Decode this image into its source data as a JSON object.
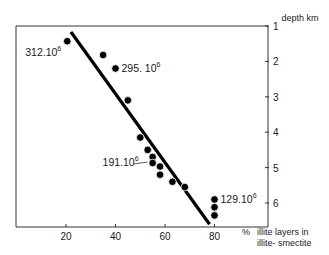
{
  "chart_data": {
    "type": "scatter",
    "title": "",
    "xlabel": "% illite layers in illite- smectite",
    "xlabel_lines": [
      "illite layers in",
      "illite- smectite"
    ],
    "xlabel_unit": "%",
    "ylabel": "depth  km",
    "xlim": [
      0,
      100
    ],
    "ylim": [
      1,
      6.7
    ],
    "y_inverted": true,
    "y_axis_side": "right",
    "x_ticks": [
      20,
      40,
      60,
      80
    ],
    "y_ticks": [
      1,
      2,
      3,
      4,
      5,
      6
    ],
    "grid": false,
    "series": [
      {
        "name": "samples",
        "points": [
          {
            "x": 20.5,
            "y": 1.43
          },
          {
            "x": 35,
            "y": 1.82
          },
          {
            "x": 40,
            "y": 2.2
          },
          {
            "x": 45,
            "y": 3.1
          },
          {
            "x": 50,
            "y": 4.15
          },
          {
            "x": 53,
            "y": 4.5
          },
          {
            "x": 55,
            "y": 4.7
          },
          {
            "x": 55,
            "y": 4.87
          },
          {
            "x": 58,
            "y": 4.97
          },
          {
            "x": 58,
            "y": 5.2
          },
          {
            "x": 63,
            "y": 5.4
          },
          {
            "x": 68,
            "y": 5.55
          },
          {
            "x": 80,
            "y": 5.9
          },
          {
            "x": 80,
            "y": 6.12
          },
          {
            "x": 80,
            "y": 6.35
          }
        ]
      }
    ],
    "trend_line": {
      "x": [
        22,
        78
      ],
      "y": [
        1.17,
        6.6
      ]
    },
    "annotations": [
      {
        "base": "312.10",
        "exp": "6",
        "x": 20.5,
        "y": 1.43,
        "position": "below-left"
      },
      {
        "base": "295. 10",
        "exp": "6",
        "x": 40,
        "y": 2.2,
        "position": "right"
      },
      {
        "base": "191.10",
        "exp": "6",
        "x": 55,
        "y": 4.87,
        "position": "left"
      },
      {
        "base": "129.10",
        "exp": "6",
        "x": 80,
        "y": 5.9,
        "position": "right"
      }
    ]
  }
}
